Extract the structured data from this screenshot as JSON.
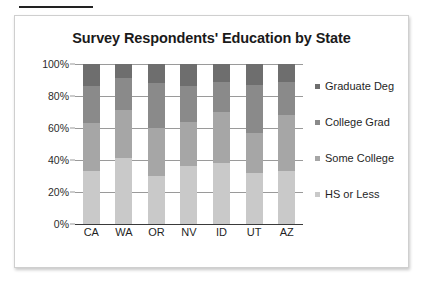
{
  "figure": {
    "top_rule": "decorative-rule"
  },
  "chart_data": {
    "type": "bar",
    "subtype": "100% stacked column",
    "title": "Survey Respondents' Education by State",
    "xlabel": "",
    "ylabel": "",
    "categories": [
      "CA",
      "WA",
      "OR",
      "NV",
      "ID",
      "UT",
      "AZ"
    ],
    "ylim": [
      0,
      100
    ],
    "ytick_labels": [
      "0%",
      "20%",
      "40%",
      "60%",
      "80%",
      "100%"
    ],
    "yticks": [
      0,
      20,
      40,
      60,
      80,
      100
    ],
    "grid": true,
    "legend_position": "right",
    "series": [
      {
        "name": "HS or Less",
        "color": "#c9c9c9",
        "values": [
          33,
          41,
          30,
          36,
          38,
          32,
          33
        ]
      },
      {
        "name": "Some College",
        "color": "#a6a6a6",
        "values": [
          30,
          30,
          30,
          28,
          32,
          25,
          35
        ]
      },
      {
        "name": "College Grad",
        "color": "#8a8a8a",
        "values": [
          23,
          20,
          28,
          22,
          19,
          30,
          21
        ]
      },
      {
        "name": "Graduate Deg",
        "color": "#6e6e6e",
        "values": [
          14,
          9,
          12,
          14,
          11,
          13,
          11
        ]
      }
    ],
    "legend_order_top_to_bottom": [
      "Graduate Deg",
      "College Grad",
      "Some College",
      "HS or Less"
    ]
  }
}
